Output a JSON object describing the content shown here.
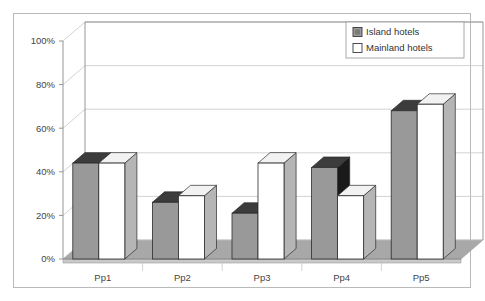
{
  "chart_data": {
    "type": "bar",
    "title": "",
    "subtitle": "",
    "xlabel": "",
    "ylabel": "",
    "categories": [
      "Pp1",
      "Pp2",
      "Pp3",
      "Pp4",
      "Pp5"
    ],
    "series": [
      {
        "name": "Island hotels",
        "color": "#999999",
        "values": [
          44,
          26,
          21,
          42,
          68
        ]
      },
      {
        "name": "Mainland hotels",
        "color": "#ffffff",
        "values": [
          44,
          29,
          44,
          29,
          71
        ]
      }
    ],
    "ylim": [
      0,
      100
    ],
    "yticks": [
      0,
      20,
      40,
      60,
      80,
      100
    ],
    "ytick_labels": [
      "0%",
      "20%",
      "40%",
      "60%",
      "80%",
      "100%"
    ],
    "grid": true,
    "three_d": true,
    "legend_position": "top-right",
    "legend": [
      {
        "label": "Island hotels",
        "swatch": "#999999"
      },
      {
        "label": "Mainland hotels",
        "swatch": "#ffffff"
      }
    ]
  },
  "colors": {
    "island_fill": "#999999",
    "island_top": "#3c3c3c",
    "island_side": "#6e6e6e",
    "mainland_fill": "#ffffff",
    "mainland_top": "#f2f2f2",
    "mainland_side": "#b5b5b5",
    "floor": "#a8a8a8",
    "floor_side": "#c9c9c9",
    "grid_line": "#c6c6c6",
    "axis_line": "#8a8a8a",
    "frame": "#b9b9b9",
    "dark_side": "#1a1a1a"
  }
}
